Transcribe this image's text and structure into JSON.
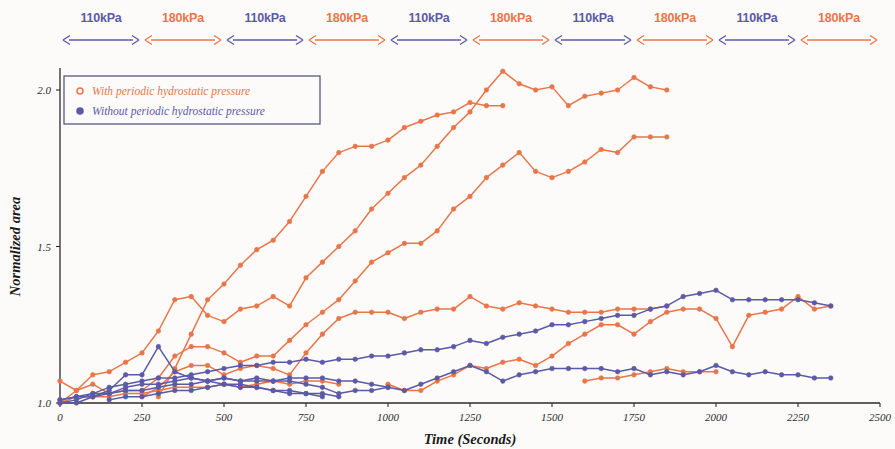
{
  "chart_data": {
    "type": "line",
    "title": "",
    "xlabel": "Time (Seconds)",
    "ylabel": "Normalized area",
    "xlim": [
      0,
      2500
    ],
    "ylim": [
      0.97,
      2.12
    ],
    "xticks": [
      0,
      250,
      500,
      750,
      1000,
      1250,
      1500,
      1750,
      2000,
      2250,
      2500
    ],
    "yticks": [
      1.0,
      1.5,
      2.0
    ],
    "ytick_labels": [
      "1.0",
      "1.5",
      "2.0"
    ],
    "grid": false,
    "legend_position": "top-left",
    "colors": {
      "orange": "#E8764A",
      "blue": "#5A5AA5",
      "axis": "#2b2b2b",
      "background": "#fdfbfa",
      "legend_border": "#4a4a7a"
    },
    "legend": [
      {
        "label": "With periodic hydrostatic pressure",
        "color": "#E8764A",
        "marker": "open-circle"
      },
      {
        "label": "Without periodic hydrostatic pressure",
        "color": "#5A5AA5",
        "marker": "filled-circle"
      }
    ],
    "pressure_bands": [
      {
        "label": "110kPa",
        "x0": 0,
        "x1": 250,
        "color": "#5A5AA5"
      },
      {
        "label": "180kPa",
        "x0": 250,
        "x1": 500,
        "color": "#E8764A"
      },
      {
        "label": "110kPa",
        "x0": 500,
        "x1": 750,
        "color": "#5A5AA5"
      },
      {
        "label": "180kPa",
        "x0": 750,
        "x1": 1000,
        "color": "#E8764A"
      },
      {
        "label": "110kPa",
        "x0": 1000,
        "x1": 1250,
        "color": "#5A5AA5"
      },
      {
        "label": "180kPa",
        "x0": 1250,
        "x1": 1500,
        "color": "#E8764A"
      },
      {
        "label": "110kPa",
        "x0": 1500,
        "x1": 1750,
        "color": "#5A5AA5"
      },
      {
        "label": "180kPa",
        "x0": 1750,
        "x1": 2000,
        "color": "#E8764A"
      },
      {
        "label": "110kPa",
        "x0": 2000,
        "x1": 2250,
        "color": "#5A5AA5"
      },
      {
        "label": "180kPa",
        "x0": 2250,
        "x1": 2500,
        "color": "#E8764A"
      }
    ],
    "series": [
      {
        "name": "With periodic hydrostatic pressure - cell 1",
        "color": "#E8764A",
        "x": [
          300,
          350,
          400,
          450,
          500,
          550,
          600,
          650,
          700,
          750,
          800,
          850,
          900,
          950,
          1000,
          1050,
          1100,
          1150,
          1200,
          1250,
          1300,
          1350
        ],
        "values": [
          1.02,
          1.11,
          1.22,
          1.33,
          1.38,
          1.44,
          1.49,
          1.52,
          1.58,
          1.66,
          1.74,
          1.8,
          1.82,
          1.82,
          1.84,
          1.88,
          1.9,
          1.92,
          1.93,
          1.96,
          1.95,
          1.95
        ]
      },
      {
        "name": "With periodic hydrostatic pressure - cell 2",
        "color": "#E8764A",
        "x": [
          0,
          50,
          100,
          150,
          200,
          250,
          300,
          350,
          400,
          450,
          500,
          550,
          600,
          650,
          700,
          750,
          800,
          850,
          900,
          950,
          1000,
          1050,
          1100,
          1150,
          1200,
          1250,
          1300,
          1350,
          1400,
          1450,
          1500,
          1550,
          1600,
          1650,
          1700,
          1750,
          1800,
          1850
        ],
        "values": [
          1.07,
          1.04,
          1.09,
          1.1,
          1.13,
          1.16,
          1.23,
          1.33,
          1.34,
          1.28,
          1.26,
          1.3,
          1.31,
          1.34,
          1.31,
          1.4,
          1.45,
          1.5,
          1.55,
          1.62,
          1.67,
          1.72,
          1.76,
          1.82,
          1.88,
          1.93,
          2.0,
          2.06,
          2.02,
          2.0,
          2.01,
          1.95,
          1.98,
          1.99,
          2.0,
          2.04,
          2.01,
          2.0
        ]
      },
      {
        "name": "With periodic hydrostatic pressure - cell 3",
        "color": "#E8764A",
        "x": [
          0,
          50,
          100,
          150,
          200,
          250,
          300,
          350,
          400,
          450,
          500,
          550,
          600,
          650,
          700,
          750,
          800,
          850,
          900,
          950,
          1000,
          1050,
          1100,
          1150,
          1200,
          1250,
          1300,
          1350,
          1400,
          1450,
          1500,
          1550,
          1600,
          1650,
          1700,
          1750,
          1800,
          1850
        ],
        "values": [
          1.0,
          1.04,
          1.06,
          1.03,
          1.04,
          1.04,
          1.08,
          1.15,
          1.18,
          1.18,
          1.16,
          1.13,
          1.15,
          1.15,
          1.2,
          1.25,
          1.29,
          1.33,
          1.39,
          1.45,
          1.48,
          1.51,
          1.51,
          1.55,
          1.62,
          1.66,
          1.72,
          1.76,
          1.8,
          1.74,
          1.72,
          1.74,
          1.77,
          1.81,
          1.8,
          1.85,
          1.85,
          1.85
        ]
      },
      {
        "name": "With periodic hydrostatic pressure - cell 4",
        "color": "#E8764A",
        "x": [
          250,
          300,
          350,
          400,
          450,
          500,
          550,
          600,
          650,
          700,
          750,
          800,
          850,
          900,
          950,
          1000,
          1050,
          1100,
          1150,
          1200,
          1250,
          1300,
          1350,
          1400,
          1450,
          1500,
          1550,
          1600,
          1650,
          1700,
          1750,
          1800,
          1850
        ],
        "values": [
          1.02,
          1.05,
          1.1,
          1.12,
          1.12,
          1.09,
          1.11,
          1.12,
          1.11,
          1.09,
          1.16,
          1.22,
          1.27,
          1.29,
          1.29,
          1.29,
          1.27,
          1.29,
          1.3,
          1.3,
          1.34,
          1.31,
          1.3,
          1.32,
          1.31,
          1.3,
          1.29,
          1.29,
          1.29,
          1.3,
          1.3,
          1.3,
          1.31
        ]
      },
      {
        "name": "With periodic hydrostatic pressure - cell 5",
        "color": "#E8764A",
        "x": [
          1000,
          1050,
          1100,
          1150,
          1200,
          1250,
          1300,
          1350,
          1400,
          1450,
          1500,
          1550,
          1600,
          1650,
          1700,
          1750,
          1800,
          1850,
          1900,
          1950,
          2000,
          2050,
          2100,
          2150,
          2200,
          2250,
          2300,
          2350
        ],
        "values": [
          1.06,
          1.04,
          1.04,
          1.07,
          1.09,
          1.12,
          1.11,
          1.13,
          1.14,
          1.12,
          1.15,
          1.19,
          1.22,
          1.25,
          1.25,
          1.22,
          1.26,
          1.29,
          1.3,
          1.3,
          1.27,
          1.18,
          1.28,
          1.29,
          1.3,
          1.34,
          1.3,
          1.31
        ]
      },
      {
        "name": "With periodic hydrostatic pressure - cell 6",
        "color": "#E8764A",
        "x": [
          0,
          50,
          100,
          150,
          200,
          250,
          300,
          350,
          400,
          450,
          500,
          550,
          600,
          650,
          700,
          750,
          800,
          850
        ],
        "values": [
          1.0,
          1.02,
          1.02,
          1.02,
          1.03,
          1.03,
          1.04,
          1.05,
          1.05,
          1.05,
          1.06,
          1.05,
          1.06,
          1.07,
          1.06,
          1.07,
          1.07,
          1.06
        ]
      },
      {
        "name": "With periodic hydrostatic pressure - cell 7",
        "color": "#E8764A",
        "x": [
          1600,
          1650,
          1700,
          1750,
          1800,
          1850,
          1900,
          1950,
          2000
        ],
        "values": [
          1.07,
          1.08,
          1.08,
          1.09,
          1.1,
          1.11,
          1.1,
          1.1,
          1.1
        ]
      },
      {
        "name": "Without periodic hydrostatic pressure - cell 1",
        "color": "#5A5AA5",
        "x": [
          0,
          50,
          100,
          150,
          200,
          250,
          300,
          350,
          400,
          450,
          500,
          550,
          600,
          650,
          700,
          750,
          800,
          850,
          900,
          950,
          1000,
          1050,
          1100,
          1150,
          1200,
          1250,
          1300,
          1350,
          1400,
          1450,
          1500,
          1550,
          1600,
          1650,
          1700,
          1750,
          1800,
          1850,
          1900,
          1950,
          2000,
          2050,
          2100,
          2150,
          2200,
          2250,
          2300,
          2350
        ],
        "values": [
          1.0,
          1.01,
          1.03,
          1.05,
          1.06,
          1.07,
          1.08,
          1.08,
          1.09,
          1.1,
          1.11,
          1.12,
          1.12,
          1.13,
          1.13,
          1.14,
          1.13,
          1.14,
          1.14,
          1.15,
          1.15,
          1.16,
          1.17,
          1.17,
          1.18,
          1.2,
          1.19,
          1.21,
          1.22,
          1.23,
          1.25,
          1.25,
          1.26,
          1.27,
          1.28,
          1.28,
          1.3,
          1.31,
          1.34,
          1.35,
          1.36,
          1.33,
          1.33,
          1.33,
          1.33,
          1.33,
          1.32,
          1.31
        ]
      },
      {
        "name": "Without periodic hydrostatic pressure - cell 2",
        "color": "#5A5AA5",
        "x": [
          0,
          50,
          100,
          150,
          200,
          250,
          300,
          350,
          400,
          450,
          500,
          550,
          600,
          650,
          700,
          750,
          800,
          850,
          900,
          950,
          1000,
          1050,
          1100,
          1150,
          1200,
          1250,
          1300,
          1350,
          1400,
          1450,
          1500,
          1550,
          1600,
          1650,
          1700,
          1750,
          1800,
          1850,
          1900,
          1950,
          2000,
          2050,
          2100,
          2150,
          2200,
          2250,
          2300,
          2350
        ],
        "values": [
          1.01,
          1.02,
          1.02,
          1.03,
          1.04,
          1.04,
          1.05,
          1.06,
          1.06,
          1.07,
          1.08,
          1.07,
          1.07,
          1.07,
          1.08,
          1.08,
          1.08,
          1.07,
          1.07,
          1.06,
          1.05,
          1.04,
          1.06,
          1.08,
          1.1,
          1.12,
          1.1,
          1.07,
          1.09,
          1.1,
          1.11,
          1.11,
          1.11,
          1.11,
          1.1,
          1.11,
          1.09,
          1.1,
          1.09,
          1.1,
          1.12,
          1.1,
          1.09,
          1.1,
          1.09,
          1.09,
          1.08,
          1.08
        ]
      },
      {
        "name": "Without periodic hydrostatic pressure - cell 3",
        "color": "#5A5AA5",
        "x": [
          0,
          50,
          100,
          150,
          200,
          250,
          300,
          350,
          400,
          450,
          500,
          550,
          600,
          650,
          700,
          750,
          800,
          850,
          900,
          950,
          1000
        ],
        "values": [
          1.0,
          1.0,
          1.02,
          1.04,
          1.09,
          1.09,
          1.18,
          1.1,
          1.08,
          1.07,
          1.08,
          1.07,
          1.08,
          1.07,
          1.07,
          1.06,
          1.05,
          1.03,
          1.04,
          1.04,
          1.05
        ]
      },
      {
        "name": "Without periodic hydrostatic pressure - cell 4",
        "color": "#5A5AA5",
        "x": [
          0,
          50,
          100,
          150,
          200,
          250,
          300,
          350,
          400,
          450,
          500,
          550,
          600,
          650,
          700,
          750,
          800
        ],
        "values": [
          1.01,
          1.02,
          1.03,
          1.03,
          1.05,
          1.06,
          1.06,
          1.07,
          1.08,
          1.07,
          1.06,
          1.06,
          1.05,
          1.04,
          1.03,
          1.03,
          1.02
        ]
      },
      {
        "name": "Without periodic hydrostatic pressure - cell 5",
        "color": "#5A5AA5",
        "x": [
          150,
          200,
          250,
          300,
          350,
          400,
          450,
          500,
          550,
          600,
          650,
          700,
          750,
          800,
          850
        ],
        "values": [
          1.01,
          1.02,
          1.02,
          1.03,
          1.04,
          1.04,
          1.05,
          1.06,
          1.05,
          1.05,
          1.04,
          1.04,
          1.03,
          1.03,
          1.02
        ]
      }
    ]
  }
}
